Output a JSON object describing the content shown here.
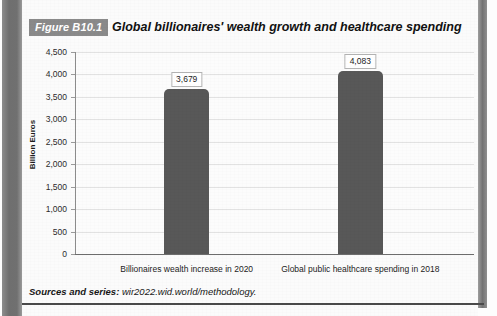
{
  "figure": {
    "label": "Figure B10.1",
    "title": "Global billionaires' wealth growth and healthcare spending",
    "label_bg": "#8a8a8a",
    "label_color": "#ffffff"
  },
  "sources": {
    "prefix": "Sources and series:",
    "text": "wir2022.wid.world/methodology."
  },
  "chart_data": {
    "type": "bar",
    "title": "Global billionaires' wealth growth and healthcare spending",
    "xlabel": "",
    "ylabel": "Billion Euros",
    "categories": [
      "Billionaires wealth increase in 2020",
      "Global public healthcare spending in 2018"
    ],
    "values": [
      3679,
      4083
    ],
    "value_labels": [
      "3,679",
      "4,083"
    ],
    "ylim": [
      0,
      4500
    ],
    "ytick_step": 500,
    "ytick_labels": [
      "0",
      "500",
      "1,000",
      "1,500",
      "2,000",
      "2,500",
      "3,000",
      "3,500",
      "4,000",
      "4,500"
    ],
    "ytick_values": [
      0,
      500,
      1000,
      1500,
      2000,
      2500,
      3000,
      3500,
      4000,
      4500
    ],
    "grid": true,
    "legend": false,
    "bar_color": "#585858",
    "gridline_color": "#e2e2e2",
    "plot_background": "#fcfcfc"
  }
}
